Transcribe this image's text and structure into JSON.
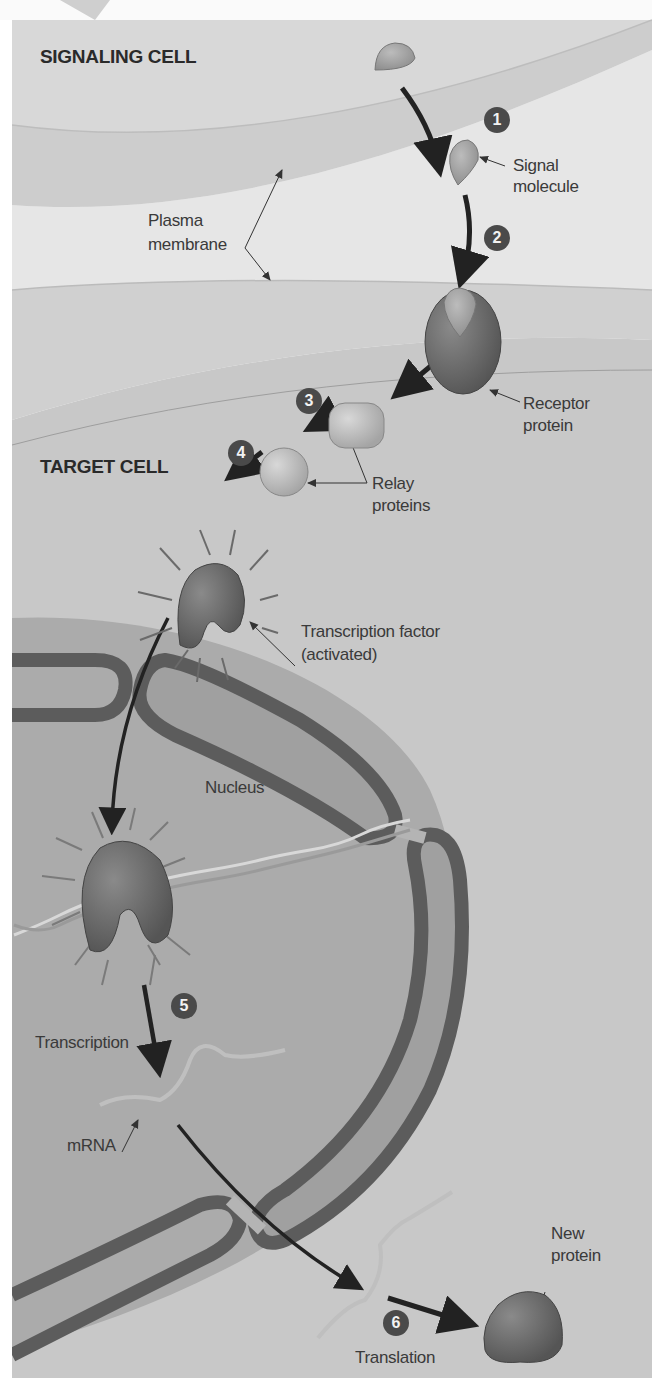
{
  "diagram": {
    "type": "cell-signaling-pathway",
    "colors": {
      "extracellular": "#e4e4e4",
      "membrane": "#cfcfcf",
      "cytoplasm": "#c6c6c6",
      "nucleus": "#aaaaaa",
      "nuclear_envelope": "#5c5c5c",
      "protein_dark": "#6a6a6a",
      "protein_light": "#bdbdbd",
      "step_badge": "#4a4a4a",
      "arrow": "#222222"
    },
    "regions": {
      "signaling_cell": "SIGNALING CELL",
      "target_cell": "TARGET CELL"
    },
    "labels": {
      "signal_molecule_1": "Signal",
      "signal_molecule_2": "molecule",
      "plasma_membrane_1": "Plasma",
      "plasma_membrane_2": "membrane",
      "receptor_1": "Receptor",
      "receptor_2": "protein",
      "relay_1": "Relay",
      "relay_2": "proteins",
      "tf_1": "Transcription factor",
      "tf_2": "(activated)",
      "nucleus": "Nucleus",
      "transcription": "Transcription",
      "mrna": "mRNA",
      "new_protein_1": "New",
      "new_protein_2": "protein",
      "translation": "Translation"
    },
    "steps": [
      "1",
      "2",
      "3",
      "4",
      "5",
      "6"
    ]
  }
}
